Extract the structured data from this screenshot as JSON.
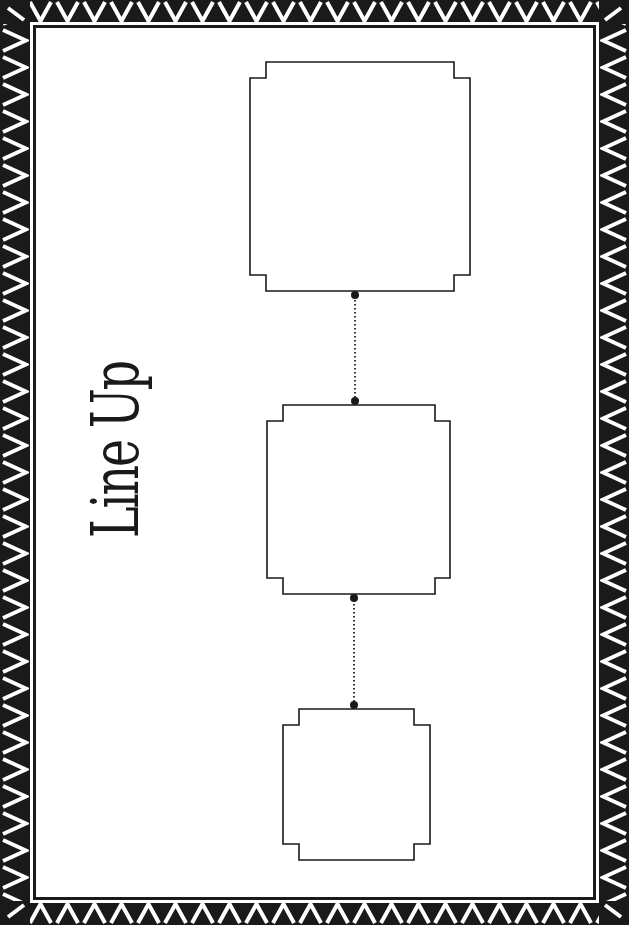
{
  "page": {
    "title": "Line Up",
    "colors": {
      "border": "#1a1a1a",
      "background": "#ffffff",
      "ink": "#1a1a1a"
    }
  },
  "lineup": {
    "boxes": [
      {
        "position": 1,
        "label": "",
        "x": 250,
        "y": 62,
        "width": 220,
        "height": 229
      },
      {
        "position": 2,
        "label": "",
        "x": 267,
        "y": 404,
        "width": 183,
        "height": 190
      },
      {
        "position": 3,
        "label": "",
        "x": 283,
        "y": 708,
        "width": 147,
        "height": 152
      }
    ],
    "connectors": [
      {
        "from": 1,
        "to": 2,
        "style": "dotted"
      },
      {
        "from": 2,
        "to": 3,
        "style": "dotted"
      }
    ]
  }
}
